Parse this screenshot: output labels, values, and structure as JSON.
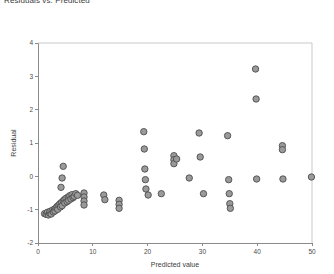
{
  "chart_data": {
    "type": "scatter",
    "title": "Residuals vs. Predicted",
    "xlabel": "Predicted value",
    "ylabel": "Residual",
    "xlim": [
      0,
      50
    ],
    "ylim": [
      -2,
      4
    ],
    "xticks": [
      0,
      10,
      20,
      30,
      40,
      50
    ],
    "yticks": [
      -2,
      -1,
      0,
      1,
      2,
      3,
      4
    ],
    "xtick_labels": [
      "0",
      "10",
      "20",
      "30",
      "40",
      "50"
    ],
    "ytick_labels": [
      "-2",
      "-1",
      "0",
      "1",
      "2",
      "3",
      "4"
    ],
    "grid": false,
    "legend": null,
    "marker": {
      "shape": "circle",
      "fill": "#9a9a9a",
      "edge": "#4d4d4d",
      "size": 3.2
    },
    "points": [
      [
        1.2,
        -1.12
      ],
      [
        1.5,
        -1.14
      ],
      [
        1.7,
        -1.08
      ],
      [
        1.9,
        -1.16
      ],
      [
        2.1,
        -1.1
      ],
      [
        2.2,
        -1.05
      ],
      [
        2.4,
        -1.13
      ],
      [
        2.6,
        -1.02
      ],
      [
        2.8,
        -1.07
      ],
      [
        3.0,
        -0.98
      ],
      [
        3.1,
        -1.04
      ],
      [
        3.3,
        -0.95
      ],
      [
        3.5,
        -0.9
      ],
      [
        3.6,
        -0.99
      ],
      [
        3.8,
        -0.86
      ],
      [
        4.0,
        -0.82
      ],
      [
        4.1,
        -0.92
      ],
      [
        4.3,
        -0.78
      ],
      [
        4.4,
        -0.88
      ],
      [
        4.6,
        -0.74
      ],
      [
        4.8,
        -0.7
      ],
      [
        4.9,
        -0.8
      ],
      [
        5.1,
        -0.66
      ],
      [
        5.3,
        -0.76
      ],
      [
        5.5,
        -0.62
      ],
      [
        5.6,
        -0.72
      ],
      [
        5.8,
        -0.58
      ],
      [
        6.0,
        -0.68
      ],
      [
        6.2,
        -0.55
      ],
      [
        6.4,
        -0.64
      ],
      [
        6.6,
        -0.6
      ],
      [
        6.9,
        -0.52
      ],
      [
        7.2,
        -0.57
      ],
      [
        4.2,
        -0.33
      ],
      [
        4.4,
        -0.05
      ],
      [
        4.6,
        0.3
      ],
      [
        8.4,
        -0.5
      ],
      [
        8.4,
        -0.62
      ],
      [
        8.4,
        -0.74
      ],
      [
        8.4,
        -0.86
      ],
      [
        12.0,
        -0.56
      ],
      [
        12.2,
        -0.7
      ],
      [
        14.8,
        -0.72
      ],
      [
        14.8,
        -0.84
      ],
      [
        14.8,
        -0.96
      ],
      [
        19.3,
        1.34
      ],
      [
        19.4,
        0.82
      ],
      [
        19.5,
        0.22
      ],
      [
        19.6,
        -0.1
      ],
      [
        19.7,
        -0.38
      ],
      [
        20.1,
        -0.56
      ],
      [
        22.5,
        -0.52
      ],
      [
        24.8,
        0.62
      ],
      [
        24.8,
        0.5
      ],
      [
        24.8,
        0.38
      ],
      [
        25.3,
        0.52
      ],
      [
        27.6,
        -0.05
      ],
      [
        29.4,
        1.3
      ],
      [
        29.6,
        0.58
      ],
      [
        30.2,
        -0.52
      ],
      [
        34.6,
        1.22
      ],
      [
        34.8,
        -0.1
      ],
      [
        34.9,
        -0.52
      ],
      [
        35.0,
        -0.82
      ],
      [
        35.1,
        -0.96
      ],
      [
        39.7,
        3.22
      ],
      [
        39.8,
        2.32
      ],
      [
        39.9,
        -0.08
      ],
      [
        44.6,
        0.92
      ],
      [
        44.6,
        0.8
      ],
      [
        44.7,
        -0.08
      ],
      [
        49.9,
        -0.02
      ]
    ]
  },
  "geometry": {
    "plot_left": 38,
    "plot_right": 312,
    "plot_top": 43,
    "plot_bottom": 243
  }
}
